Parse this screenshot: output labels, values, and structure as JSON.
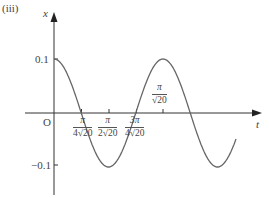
{
  "label": "(iii)",
  "chart_data": {
    "type": "line",
    "title": "",
    "xlabel": "t",
    "ylabel": "x",
    "function": "x = 0.1 cos(√20 t)",
    "y_ticks": [
      {
        "value": 0.1,
        "label": "0.1"
      },
      {
        "value": -0.1,
        "label": "−0.1"
      }
    ],
    "origin_label": "O",
    "x_ticks": [
      {
        "value": "π/(4√20)",
        "num": "π",
        "den": "4√20",
        "position": "below"
      },
      {
        "value": "π/(2√20)",
        "num": "π",
        "den": "2√20",
        "position": "below"
      },
      {
        "value": "3π/(4√20)",
        "num": "3π",
        "den": "4√20",
        "position": "below"
      },
      {
        "value": "π/√20",
        "num": "π",
        "den": "√20",
        "position": "above"
      }
    ],
    "key_points": [
      {
        "t": "0",
        "x": 0.1
      },
      {
        "t": "π/(4√20)",
        "x": 0
      },
      {
        "t": "π/(2√20)",
        "x": -0.1
      },
      {
        "t": "3π/(4√20)",
        "x": 0
      },
      {
        "t": "π/√20",
        "x": 0.1
      },
      {
        "t": "5π/(4√20)",
        "x": 0
      },
      {
        "t": "3π/(2√20)",
        "x": -0.1
      }
    ],
    "ylim": [
      -0.15,
      0.15
    ],
    "grid": false,
    "legend": null
  },
  "colors": {
    "axis": "#333333",
    "curve": "#666666"
  }
}
